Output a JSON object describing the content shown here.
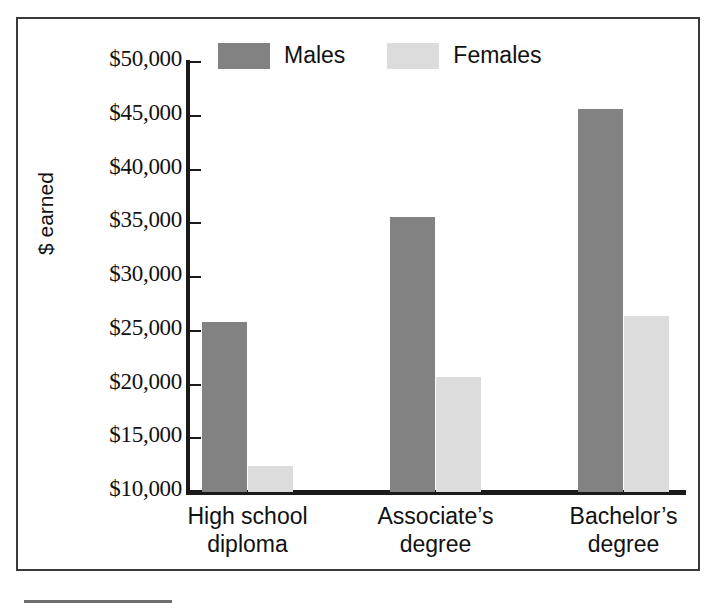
{
  "chart_data": {
    "type": "bar",
    "title": "",
    "xlabel": "",
    "ylabel": "$ earned",
    "ylim": [
      10000,
      50000
    ],
    "ytick_step": 5000,
    "grid": false,
    "legend_position": "top",
    "categories": [
      {
        "line1": "High school",
        "line2": "diploma"
      },
      {
        "line1": "Associate’s",
        "line2": "degree"
      },
      {
        "line1": "Bachelor’s",
        "line2": "degree"
      }
    ],
    "category_labels": [
      "High school diploma",
      "Associate’s degree",
      "Bachelor’s degree"
    ],
    "ytick_labels": [
      "$50,000",
      "$45,000",
      "$40,000",
      "$35,000",
      "$30,000",
      "$25,000",
      "$20,000",
      "$15,000",
      "$10,000"
    ],
    "ytick_values": [
      50000,
      45000,
      40000,
      35000,
      30000,
      25000,
      20000,
      15000,
      10000
    ],
    "series": [
      {
        "name": "Males",
        "color": "#828282",
        "values": [
          25800,
          35600,
          45600
        ]
      },
      {
        "name": "Females",
        "color": "#dcdcdc",
        "values": [
          12400,
          20700,
          26400
        ]
      }
    ]
  },
  "legend": {
    "items": [
      {
        "label": "Males",
        "swatch": "males"
      },
      {
        "label": "Females",
        "swatch": "females"
      }
    ]
  },
  "axis": {
    "y_title": "$ earned"
  },
  "colors": {
    "males_bar": "#828282",
    "females_bar": "#dcdcdc",
    "axis_line": "#1a1a1a",
    "frame_border": "#3a3a3a",
    "text": "#111111",
    "background": "#ffffff"
  }
}
